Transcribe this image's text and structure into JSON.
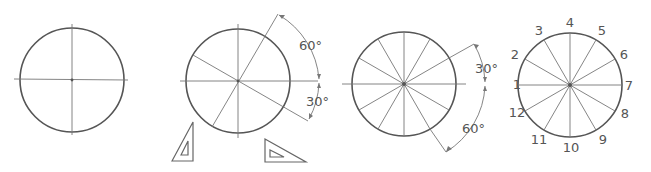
{
  "figure": {
    "panels": [
      {
        "id": "step-1",
        "description": "circle with horizontal and vertical center lines"
      },
      {
        "id": "step-2",
        "description": "30-60 degree lines drawn with triangles",
        "angles": {
          "upper": "60°",
          "lower": "30°"
        }
      },
      {
        "id": "step-3",
        "description": "circle divided into 12 equal parts",
        "angles": {
          "upper": "30°",
          "lower": "60°"
        }
      },
      {
        "id": "step-4",
        "description": "division points numbered 1 through 12"
      }
    ],
    "labels": {
      "p2_upper_angle": "60°",
      "p2_lower_angle": "30°",
      "p3_upper_angle": "30°",
      "p3_lower_angle": "60°"
    },
    "points": [
      "1",
      "2",
      "3",
      "4",
      "5",
      "6",
      "7",
      "8",
      "9",
      "10",
      "11",
      "12"
    ]
  }
}
